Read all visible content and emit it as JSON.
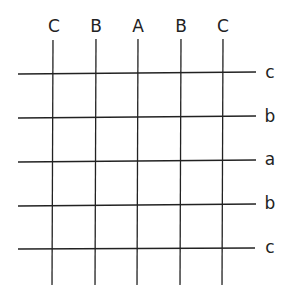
{
  "diagram": {
    "column_labels": [
      "C",
      "B",
      "A",
      "B",
      "C"
    ],
    "row_labels": [
      "c",
      "b",
      "a",
      "b",
      "c"
    ],
    "column_x": [
      53,
      96,
      138,
      181,
      223
    ],
    "row_y": [
      73,
      117,
      161,
      205,
      249
    ],
    "line_color": "#222222"
  }
}
